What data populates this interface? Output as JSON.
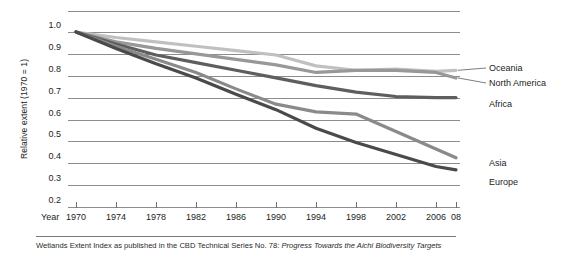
{
  "figure": {
    "caption_plain": "Wetlands Extent Index as published in the CBD Technical Series No. 78:",
    "caption_italic": "Progress Towards the Aichi Biodiversity Targets"
  },
  "axes": {
    "y_title": "Relative extent (1970 = 1)",
    "y_ticks": [
      "1.0",
      "0.9",
      "0.8",
      "0.7",
      "0.6",
      "0.5",
      "0.4",
      "0.3",
      "0.2"
    ],
    "x_title": "Year",
    "x_ticks": [
      "1970",
      "1974",
      "1978",
      "1982",
      "1986",
      "1990",
      "1994",
      "1998",
      "2002",
      "2006",
      "08"
    ]
  },
  "legend": {
    "oceania": "Oceania",
    "north_america": "North America",
    "africa": "Africa",
    "asia": "Asia",
    "europe": "Europe"
  },
  "colors": {
    "oceania": "#c0c0c0",
    "north_america": "#989898",
    "africa": "#5e5e5e",
    "asia": "#8a8a8a",
    "europe": "#4a4a4a",
    "grid": "#8d8d8d",
    "text": "#1d1d1d"
  },
  "chart_data": {
    "type": "line",
    "title": "Wetlands Extent Index",
    "xlabel": "Year",
    "ylabel": "Relative extent (1970 = 1)",
    "xlim": [
      1970,
      2008
    ],
    "ylim": [
      0.2,
      1.05
    ],
    "grid": true,
    "legend_position": "right-of-plot-annotated",
    "x": [
      1970,
      1974,
      1978,
      1982,
      1986,
      1990,
      1994,
      1998,
      2002,
      2006,
      2008
    ],
    "series": [
      {
        "name": "Oceania",
        "color": "#c0c0c0",
        "values": [
          1.0,
          0.975,
          0.955,
          0.935,
          0.915,
          0.895,
          0.845,
          0.825,
          0.83,
          0.82,
          0.825
        ]
      },
      {
        "name": "North America",
        "color": "#989898",
        "values": [
          1.0,
          0.955,
          0.925,
          0.9,
          0.875,
          0.85,
          0.815,
          0.825,
          0.825,
          0.815,
          0.79
        ]
      },
      {
        "name": "Africa",
        "color": "#5e5e5e",
        "values": [
          1.0,
          0.945,
          0.895,
          0.86,
          0.825,
          0.79,
          0.755,
          0.725,
          0.705,
          0.7,
          0.7
        ]
      },
      {
        "name": "Asia",
        "color": "#8a8a8a",
        "values": [
          1.0,
          0.935,
          0.875,
          0.815,
          0.74,
          0.67,
          0.635,
          0.625,
          0.545,
          0.465,
          0.425
        ]
      },
      {
        "name": "Europe",
        "color": "#4a4a4a",
        "values": [
          1.0,
          0.925,
          0.855,
          0.79,
          0.715,
          0.645,
          0.56,
          0.495,
          0.44,
          0.385,
          0.37
        ]
      }
    ]
  }
}
